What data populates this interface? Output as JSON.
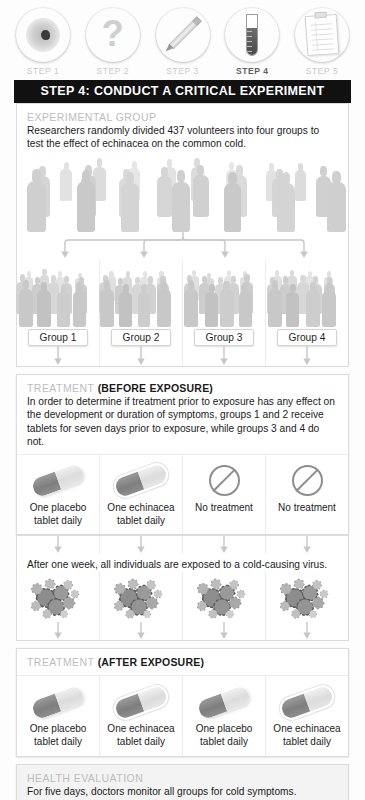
{
  "steps": {
    "items": [
      {
        "label": "STEP 1",
        "icon": "petri-dish-icon",
        "active": false
      },
      {
        "label": "STEP 2",
        "icon": "question-mark-icon",
        "active": false
      },
      {
        "label": "STEP 3",
        "icon": "pencil-icon",
        "active": false
      },
      {
        "label": "STEP 4",
        "icon": "test-tube-icon",
        "active": true
      },
      {
        "label": "STEP 5",
        "icon": "clipboard-icon",
        "active": false
      }
    ]
  },
  "banner": {
    "title": "STEP 4: CONDUCT A CRITICAL EXPERIMENT"
  },
  "experimental_group": {
    "heading": "EXPERIMENTAL GROUP",
    "body": "Researchers randomly divided 437 volunteers into four groups to test the effect of echinacea on the common cold.",
    "volunteers": "437",
    "group_count": "4"
  },
  "groups": [
    {
      "label": "Group 1"
    },
    {
      "label": "Group 2"
    },
    {
      "label": "Group 3"
    },
    {
      "label": "Group 4"
    }
  ],
  "treatment_before": {
    "heading": "TREATMENT",
    "heading_bold": "(BEFORE EXPOSURE)",
    "body": "In order to determine if treatment prior to exposure has any effect on the development or duration of symptoms, groups 1 and 2 receive tablets for seven days prior to exposure, while groups 3 and 4 do not.",
    "cells": [
      {
        "icon": "placebo-capsule-icon",
        "line1": "One placebo",
        "line2": "tablet daily"
      },
      {
        "icon": "echinacea-capsule-icon",
        "line1": "One echinacea",
        "line2": "tablet daily"
      },
      {
        "icon": "no-treatment-icon",
        "line1": "No treatment",
        "line2": ""
      },
      {
        "icon": "no-treatment-icon",
        "line1": "No treatment",
        "line2": ""
      }
    ]
  },
  "exposure": {
    "note": "After one week, all individuals are exposed to a cold-causing virus.",
    "cells": [
      {
        "icon": "virus-cluster-icon"
      },
      {
        "icon": "virus-cluster-icon"
      },
      {
        "icon": "virus-cluster-icon"
      },
      {
        "icon": "virus-cluster-icon"
      }
    ]
  },
  "treatment_after": {
    "heading": "TREATMENT",
    "heading_bold": "(AFTER EXPOSURE)",
    "cells": [
      {
        "icon": "placebo-capsule-icon",
        "line1": "One placebo",
        "line2": "tablet daily"
      },
      {
        "icon": "echinacea-capsule-icon",
        "line1": "One echinacea",
        "line2": "tablet daily"
      },
      {
        "icon": "placebo-capsule-icon",
        "line1": "One placebo",
        "line2": "tablet daily"
      },
      {
        "icon": "echinacea-capsule-icon",
        "line1": "One echinacea",
        "line2": "tablet daily"
      }
    ]
  },
  "health_evaluation": {
    "heading": "HEALTH EVALUATION",
    "body": "For five days, doctors monitor all groups for cold symptoms."
  },
  "colors": {
    "banner_bg": "#111111",
    "heading_gray": "#bdbdbd",
    "text": "#1b1b1b",
    "capsule_dark": "#8a8a8a",
    "capsule_light": "#e4e4e4",
    "virus": "#8d8d8d",
    "arrow": "#c2c2c2"
  }
}
